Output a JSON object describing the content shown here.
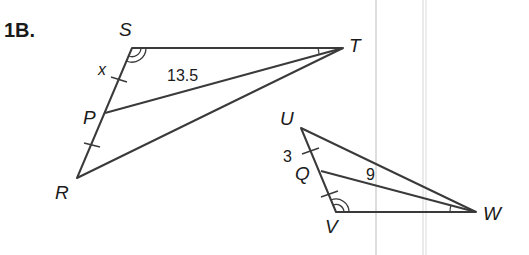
{
  "problem": {
    "label": "1B."
  },
  "figure1": {
    "vertices": {
      "S": "S",
      "T": "T",
      "P": "P",
      "R": "R"
    },
    "segment_labels": {
      "SP": "x",
      "PT": "13.5"
    }
  },
  "figure2": {
    "vertices": {
      "U": "U",
      "Q": "Q",
      "V": "V",
      "W": "W"
    },
    "segment_labels": {
      "UQ": "3",
      "QW": "9"
    }
  },
  "colors": {
    "line": "#3a3a3a",
    "guide": "#cfcfcf",
    "text": "#1a1a1a"
  }
}
